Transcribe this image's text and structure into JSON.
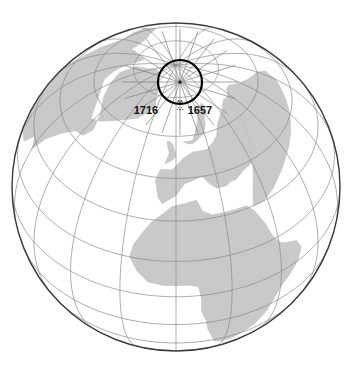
{
  "figure": {
    "kind": "orthographic-globe-map",
    "background_color": "#ffffff",
    "width": 355,
    "height": 365
  },
  "globe": {
    "name": "earth-globe",
    "center_x": 176,
    "center_y": 187,
    "radius": 164,
    "outline_color": "#3a3a3a",
    "outline_width": 1.4,
    "ocean_color": "#ffffff",
    "land_color": "#c9c9c9",
    "land_edge_color": "#bdbdbd",
    "projection": "orthographic",
    "center_lon": 0,
    "center_lat": 42
  },
  "graticule": {
    "name": "lat-lon-grid",
    "line_color": "#8a8a8a",
    "line_width": 0.7,
    "meridian_step_deg": 20,
    "parallel_step_deg": 15,
    "meridians": [
      -180,
      -160,
      -140,
      -120,
      -100,
      -80,
      -60,
      -40,
      -20,
      0,
      20,
      40,
      60,
      80,
      100,
      120,
      140,
      160
    ],
    "parallels": [
      -30,
      -15,
      0,
      15,
      30,
      45,
      60,
      75
    ]
  },
  "polar_inset": {
    "name": "polar-projection-circle",
    "center_x": 180,
    "center_y": 82,
    "radius": 22,
    "stroke_color": "#000000",
    "stroke_width": 2.2,
    "pole_dot_color": "#1a1a1a",
    "pole_dot_radius": 1.6,
    "spoke_count": 20,
    "spoke_color": "#7d7d7d",
    "spoke_length": 58
  },
  "annotations": {
    "left_label": "1716",
    "right_label": "1657",
    "tick_marks": "ʌʌ",
    "label_y": 114,
    "left_label_x": 146,
    "right_label_x": 186,
    "small_mark_top": "ʌʌ",
    "small_mark_bottom": "∴∴"
  },
  "landmasses": [
    {
      "name": "greenland-north-america",
      "color": "#c9c9c9"
    },
    {
      "name": "europe",
      "color": "#c9c9c9"
    },
    {
      "name": "africa",
      "color": "#c9c9c9"
    },
    {
      "name": "scandinavia",
      "color": "#c9c9c9"
    },
    {
      "name": "british-isles",
      "color": "#c9c9c9"
    },
    {
      "name": "middle-east-asia",
      "color": "#c9c9c9"
    }
  ]
}
